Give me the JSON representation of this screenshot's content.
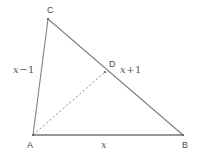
{
  "figure": {
    "type": "geometry-diagram",
    "background_color": "#ffffff",
    "line_color": "#808080",
    "base_line_color": "#737373",
    "dashed_line_color": "#8c8c8c",
    "label_color": "#4d4d4d",
    "math_label_color": "#595959",
    "points": {
      "A": {
        "x": 33,
        "y": 135,
        "label": "A"
      },
      "B": {
        "x": 183,
        "y": 135,
        "label": "B"
      },
      "C": {
        "x": 48,
        "y": 19,
        "label": "C"
      },
      "D": {
        "x": 105,
        "y": 72,
        "label": "D"
      }
    },
    "segments": [
      {
        "name": "side-AC",
        "from": "A",
        "to": "C",
        "style": "solid"
      },
      {
        "name": "side-CB",
        "from": "C",
        "to": "B",
        "style": "solid"
      },
      {
        "name": "side-AB",
        "from": "A",
        "to": "B",
        "style": "solid"
      },
      {
        "name": "cevian-AD",
        "from": "A",
        "to": "D",
        "style": "dashed"
      }
    ],
    "measure_labels": {
      "side_ac": {
        "var": "x",
        "op": "−",
        "num": "1",
        "full": "x − 1"
      },
      "side_db": {
        "var": "x",
        "op": "+",
        "num": "1",
        "full": "x + 1"
      },
      "side_ab": {
        "var": "x",
        "op": "",
        "num": "",
        "full": "x"
      }
    }
  }
}
